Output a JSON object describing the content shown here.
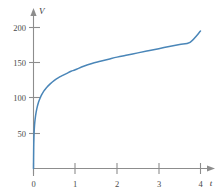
{
  "chart_data": {
    "type": "line",
    "title": "",
    "subtitle": "",
    "xlabel": "t",
    "ylabel": "V",
    "xlim": [
      0,
      4.35
    ],
    "ylim": [
      0,
      215
    ],
    "grid": false,
    "legend": null,
    "x_ticks": [
      0,
      1,
      2,
      3,
      4
    ],
    "x_tick_labels": [
      "0",
      "1",
      "2",
      "3",
      "4"
    ],
    "y_ticks": [
      50,
      100,
      150,
      200
    ],
    "y_tick_labels": [
      "50",
      "100",
      "150",
      "200"
    ],
    "series": [
      {
        "name": "V(t)",
        "color": "#4a86b8",
        "x": [
          0,
          0.005,
          0.01,
          0.02,
          0.03,
          0.05,
          0.08,
          0.12,
          0.16,
          0.2,
          0.25,
          0.3,
          0.4,
          0.5,
          0.6,
          0.7,
          0.8,
          0.9,
          1.0,
          1.2,
          1.4,
          1.6,
          1.8,
          2.0,
          2.25,
          2.5,
          2.75,
          3.0,
          3.25,
          3.5,
          3.75,
          4.0
        ],
        "y": [
          0,
          30,
          43,
          57,
          65,
          75,
          85,
          94,
          100,
          105,
          110,
          114,
          120,
          125,
          129,
          132,
          135,
          138,
          140,
          145,
          149,
          152,
          155,
          158,
          161,
          164,
          167,
          170,
          173,
          176,
          179,
          195
        ]
      }
    ]
  },
  "axes": {
    "x_axis_label": "t",
    "y_axis_label": "V"
  },
  "colors": {
    "curve": "#4a86b8",
    "axis": "#8d8d8d",
    "tick_text": "#4a4a4a",
    "background": "#ffffff"
  }
}
